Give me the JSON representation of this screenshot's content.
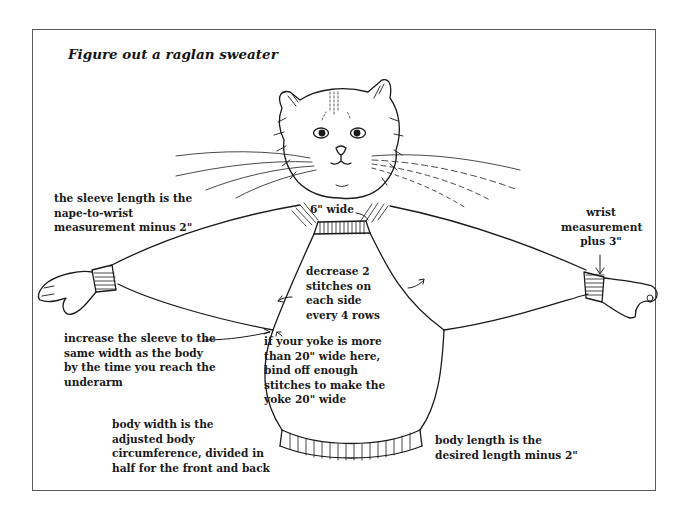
{
  "figure": {
    "title": "Figure out a raglan sweater"
  },
  "annotations": {
    "neck": {
      "lines": [
        "6\" wide"
      ]
    },
    "sleeve_length": {
      "lines": [
        "the sleeve length is the",
        "nape-to-wrist",
        "measurement minus 2\""
      ]
    },
    "wrist": {
      "lines": [
        "wrist",
        "measurement",
        "plus 3\""
      ]
    },
    "decrease": {
      "lines": [
        "decrease 2",
        "stitches on",
        "each side",
        "every 4 rows"
      ]
    },
    "sleeve_increase": {
      "lines": [
        "increase the sleeve to the",
        "same width as the body",
        "by the time you reach the",
        "underarm"
      ]
    },
    "yoke": {
      "lines": [
        "if your yoke is more",
        "than 20\" wide here,",
        "bind off enough",
        "stitches to make the",
        "yoke 20\" wide"
      ]
    },
    "body_width": {
      "lines": [
        "body width is the",
        "adjusted body",
        "circumference, divided in",
        "half for the front and back"
      ]
    },
    "body_length": {
      "lines": [
        "body length is the",
        "desired length minus 2\""
      ]
    }
  },
  "colors": {
    "ink": "#1a1a1a",
    "frame": "#5a5a5a",
    "background": "#ffffff"
  }
}
